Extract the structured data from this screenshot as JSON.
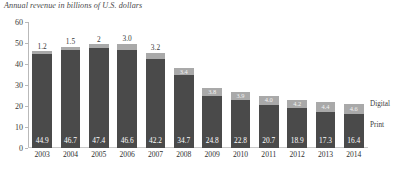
{
  "chart_data": {
    "type": "bar",
    "title": "Annual revenue in billions of U.S. dollars",
    "xlabel": "",
    "ylabel": "",
    "ylim": [
      0,
      60
    ],
    "yticks": [
      0,
      10,
      20,
      30,
      40,
      50,
      60
    ],
    "grid": false,
    "stacked": true,
    "legend_position": "right",
    "categories": [
      "2003",
      "2004",
      "2005",
      "2006",
      "2007",
      "2008",
      "2009",
      "2010",
      "2011",
      "2012",
      "2013",
      "2014"
    ],
    "series": [
      {
        "name": "Print",
        "color": "#4a4a4a",
        "values": [
          44.9,
          46.7,
          47.4,
          46.6,
          42.2,
          34.7,
          24.8,
          22.8,
          20.7,
          18.9,
          17.3,
          16.4
        ],
        "labels": [
          "44.9",
          "46.7",
          "47.4",
          "46.6",
          "42.2",
          "34.7",
          "24.8",
          "22.8",
          "20.7",
          "18.9",
          "17.3",
          "16.4"
        ]
      },
      {
        "name": "Digital",
        "color": "#a9a9a9",
        "values": [
          1.2,
          1.5,
          2,
          3.0,
          3.2,
          3.4,
          3.8,
          3.9,
          4.0,
          4.2,
          4.4,
          4.6
        ],
        "labels": [
          "1.2",
          "1.5",
          "2",
          "3.0",
          "3.2",
          "3.4",
          "3.8",
          "3.9",
          "4.0",
          "4.2",
          "4.4",
          "4.6"
        ]
      }
    ],
    "legend": [
      {
        "name": "Digital",
        "color": "#a9a9a9"
      },
      {
        "name": "Print",
        "color": "#4a4a4a"
      }
    ]
  }
}
